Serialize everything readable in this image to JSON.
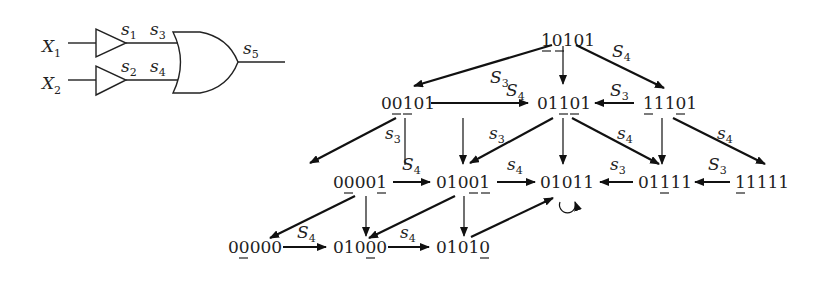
{
  "circuit": {
    "inputs": [
      {
        "name": "X",
        "sub": "1"
      },
      {
        "name": "X",
        "sub": "2"
      }
    ],
    "signals": [
      {
        "name": "s",
        "sub": "1"
      },
      {
        "name": "s",
        "sub": "2"
      },
      {
        "name": "s",
        "sub": "3"
      },
      {
        "name": "s",
        "sub": "4"
      },
      {
        "name": "s",
        "sub": "5"
      }
    ],
    "gates": [
      "buffer",
      "buffer",
      "or"
    ]
  },
  "graph": {
    "nodes": [
      {
        "id": "n10101",
        "label": "10101",
        "underlined": [
          0,
          1
        ]
      },
      {
        "id": "n00101",
        "label": "00101",
        "underlined": [
          1,
          2
        ]
      },
      {
        "id": "n01101",
        "label": "01101",
        "underlined": [
          2,
          3
        ]
      },
      {
        "id": "n11101",
        "label": "11101",
        "underlined": [
          0,
          3
        ]
      },
      {
        "id": "n00001",
        "label": "00001",
        "underlined": [
          1,
          4
        ]
      },
      {
        "id": "n01001",
        "label": "01001",
        "underlined": [
          3,
          4
        ]
      },
      {
        "id": "n01011",
        "label": "01011",
        "underlined": []
      },
      {
        "id": "n01111",
        "label": "01111",
        "underlined": [
          2
        ]
      },
      {
        "id": "n11111",
        "label": "11111",
        "underlined": [
          0
        ]
      },
      {
        "id": "n00000",
        "label": "00000",
        "underlined": [
          1
        ]
      },
      {
        "id": "n01000",
        "label": "01000",
        "underlined": [
          3
        ]
      },
      {
        "id": "n01010",
        "label": "01010",
        "underlined": [
          4
        ]
      }
    ],
    "edge_labels": [
      {
        "id": "e1",
        "from": "10101",
        "to": "00101",
        "text": "S",
        "sub": "3"
      },
      {
        "id": "e2",
        "from": "10101",
        "to": "11101",
        "text": "S",
        "sub": "4"
      },
      {
        "id": "e3",
        "from": "00101",
        "to": "01101",
        "text": "S",
        "sub": "4"
      },
      {
        "id": "e4",
        "from": "11101",
        "to": "01101",
        "text": "S",
        "sub": "3"
      },
      {
        "id": "e5",
        "from": "00101",
        "to": "00001",
        "text": "s",
        "sub": "3"
      },
      {
        "id": "e6",
        "from": "01101",
        "to": "01001",
        "text": "s",
        "sub": "3"
      },
      {
        "id": "e7",
        "from": "01101",
        "to": "01111",
        "text": "s",
        "sub": "4"
      },
      {
        "id": "e8",
        "from": "11101",
        "to": "11111",
        "text": "s",
        "sub": "4"
      },
      {
        "id": "e9",
        "from": "00001",
        "to": "01001",
        "text": "S",
        "sub": "4"
      },
      {
        "id": "e10",
        "from": "01001",
        "to": "01011",
        "text": "s",
        "sub": "4"
      },
      {
        "id": "e11",
        "from": "01111",
        "to": "01011",
        "text": "s",
        "sub": "3"
      },
      {
        "id": "e12",
        "from": "11111",
        "to": "01111",
        "text": "S",
        "sub": "3"
      },
      {
        "id": "e13",
        "from": "00000",
        "to": "01000",
        "text": "S",
        "sub": "4"
      },
      {
        "id": "e14",
        "from": "01000",
        "to": "01010",
        "text": "s",
        "sub": "4"
      }
    ],
    "self_loop": "01011"
  }
}
